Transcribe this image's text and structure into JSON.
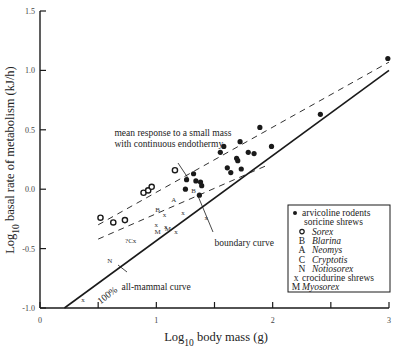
{
  "chart_data": {
    "type": "scatter",
    "title": "",
    "xlabel": "Log10 body mass (g)",
    "ylabel": "Log10 basal rate of metabolism (kJ/h)",
    "xlabel_parts": {
      "pre": "Log",
      "sub": "10",
      "post": " body mass (g)"
    },
    "ylabel_parts": {
      "pre": "Log",
      "sub": "10",
      "post": " basal rate of metabolism (kJ/h)"
    },
    "xlim": [
      0,
      3
    ],
    "ylim": [
      -1.0,
      1.5
    ],
    "grid": false,
    "x_ticks": [
      {
        "value": 0,
        "label": "0"
      },
      {
        "value": 0.5,
        "label": ""
      },
      {
        "value": 1,
        "label": "1"
      },
      {
        "value": 1.5,
        "label": ""
      },
      {
        "value": 2,
        "label": "2"
      },
      {
        "value": 2.5,
        "label": ""
      },
      {
        "value": 3,
        "label": "3"
      }
    ],
    "y_ticks": [
      {
        "value": 1.5,
        "label": "1.5"
      },
      {
        "value": 1.0,
        "label": "1.0"
      },
      {
        "value": 0.5,
        "label": "0.5"
      },
      {
        "value": 0.0,
        "label": "0.0"
      },
      {
        "value": -0.5,
        "label": "-0.5"
      },
      {
        "value": -1.0,
        "label": "-1.0"
      }
    ],
    "lines": [
      {
        "name": "all-mammal curve",
        "style": "solid",
        "points": [
          [
            0.21,
            -1.0
          ],
          [
            3.0,
            1.0
          ]
        ]
      },
      {
        "name": "mean response to a small mass with continuous endothermy (upper)",
        "style": "dashed",
        "points": [
          [
            0.5,
            -0.3
          ],
          [
            3.0,
            1.07
          ]
        ]
      },
      {
        "name": "boundary curve (lower dashed)",
        "style": "dashed",
        "points": [
          [
            0.5,
            -0.42
          ],
          [
            1.95,
            0.2
          ]
        ]
      }
    ],
    "series": [
      {
        "name": "arvicoline rodents",
        "marker": "filled-circle",
        "points": [
          [
            1.32,
            0.13
          ],
          [
            1.26,
            0.08
          ],
          [
            1.34,
            0.07
          ],
          [
            1.38,
            0.06
          ],
          [
            1.39,
            0.03
          ],
          [
            1.25,
            0.0
          ],
          [
            1.37,
            -0.05
          ],
          [
            1.58,
            0.36
          ],
          [
            1.55,
            0.31
          ],
          [
            1.72,
            0.4
          ],
          [
            1.69,
            0.26
          ],
          [
            1.7,
            0.24
          ],
          [
            1.79,
            0.31
          ],
          [
            1.84,
            0.3
          ],
          [
            1.61,
            0.18
          ],
          [
            1.64,
            0.14
          ],
          [
            1.73,
            0.17
          ],
          [
            1.99,
            0.36
          ],
          [
            1.89,
            0.52
          ],
          [
            2.41,
            0.63
          ],
          [
            2.99,
            1.1
          ]
        ]
      },
      {
        "name": "Sorex",
        "marker": "open-circle",
        "points": [
          [
            0.52,
            -0.24
          ],
          [
            0.63,
            -0.28
          ],
          [
            0.73,
            -0.26
          ],
          [
            0.89,
            -0.03
          ],
          [
            0.93,
            -0.01
          ],
          [
            0.96,
            0.02
          ],
          [
            1.16,
            0.16
          ]
        ]
      },
      {
        "name": "Blarina",
        "marker": "B",
        "points": [
          [
            1.32,
            -0.01
          ],
          [
            1.01,
            -0.17
          ]
        ]
      },
      {
        "name": "Neomys",
        "marker": "A",
        "points": [
          [
            1.15,
            -0.09
          ]
        ]
      },
      {
        "name": "Cryptotis",
        "marker": "?Cx",
        "points": [
          [
            0.78,
            -0.43
          ]
        ]
      },
      {
        "name": "Notiosorex",
        "marker": "N",
        "points": [
          [
            0.6,
            -0.6
          ]
        ]
      },
      {
        "name": "crocidurine shrews",
        "marker": "x",
        "points": [
          [
            1.07,
            -0.21
          ],
          [
            1.23,
            -0.2
          ],
          [
            1.0,
            -0.3
          ],
          [
            1.08,
            -0.31
          ],
          [
            1.17,
            -0.36
          ],
          [
            0.37,
            -0.93
          ],
          [
            1.43,
            -0.24
          ]
        ]
      },
      {
        "name": "Myosorex",
        "marker": "M",
        "points": [
          [
            1.1,
            -0.33
          ],
          [
            1.01,
            -0.36
          ]
        ]
      }
    ],
    "annotations": [
      {
        "text_lines": [
          "mean response to a small mass",
          "with continuous endothermy"
        ],
        "x": 0.64,
        "y": 0.45
      },
      {
        "text": "boundary curve",
        "x": 1.5,
        "y": -0.48
      },
      {
        "text": "all-mammal curve",
        "x": 0.7,
        "y": -0.85
      },
      {
        "text": "100%",
        "x": 0.52,
        "y": -0.97,
        "rotate": -38
      }
    ],
    "legend": {
      "position": "lower right",
      "entries": [
        {
          "symbol": "filled-circle",
          "label": "arvicoline rodents",
          "italic": false,
          "indent": 0
        },
        {
          "symbol": "",
          "label": "soricine shrews",
          "italic": false,
          "indent": 0
        },
        {
          "symbol": "open-circle",
          "label": "Sorex",
          "italic": true,
          "indent": 1
        },
        {
          "symbol": "B",
          "label": "Blarina",
          "italic": true,
          "indent": 1
        },
        {
          "symbol": "A",
          "label": "Neomys",
          "italic": true,
          "indent": 1
        },
        {
          "symbol": "C",
          "label": "Cryptotis",
          "italic": true,
          "indent": 1
        },
        {
          "symbol": "N",
          "label": "Notiosorex",
          "italic": true,
          "indent": 1
        },
        {
          "symbol": "x",
          "label": "crocidurine shrews",
          "italic": false,
          "indent": 0
        },
        {
          "symbol": "M",
          "label": "Myosorex",
          "italic": true,
          "indent": 0
        }
      ]
    }
  },
  "colors": {
    "ink": "#1a1a1a",
    "tick_label": "#444444",
    "background": "#ffffff"
  }
}
